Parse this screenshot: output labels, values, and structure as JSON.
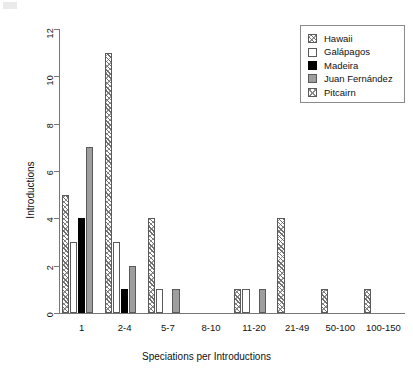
{
  "chart_data": {
    "type": "bar",
    "title": "",
    "xlabel": "Speciations per Introductions",
    "ylabel": "Introductions",
    "categories": [
      "1",
      "2-4",
      "5-7",
      "8-10",
      "11-20",
      "21-49",
      "50-100",
      "100-150"
    ],
    "ylim": [
      0,
      12
    ],
    "yticks": [
      0,
      2,
      4,
      6,
      8,
      10,
      12
    ],
    "grid": false,
    "legend_position": "top-right",
    "series": [
      {
        "name": "Hawaii",
        "pattern": "diagonal-hatch",
        "values": [
          5,
          11,
          4,
          0,
          1,
          4,
          1,
          1
        ]
      },
      {
        "name": "Galápagos",
        "pattern": "empty",
        "values": [
          3,
          3,
          1,
          0,
          1,
          0,
          0,
          0
        ]
      },
      {
        "name": "Madeira",
        "pattern": "solid-black",
        "values": [
          4,
          1,
          0,
          0,
          0,
          0,
          0,
          0
        ]
      },
      {
        "name": "Juan Fernández",
        "pattern": "solid-gray",
        "values": [
          7,
          2,
          1,
          0,
          1,
          0,
          0,
          0
        ]
      },
      {
        "name": "Pitcairn",
        "pattern": "cross-hatch",
        "values": [
          0,
          0,
          0,
          0,
          0,
          0,
          0,
          0
        ]
      }
    ]
  },
  "legend": {
    "items": [
      {
        "label": "Hawaii"
      },
      {
        "label": "Galápagos"
      },
      {
        "label": "Madeira"
      },
      {
        "label": "Juan Fernández"
      },
      {
        "label": "Pitcairn"
      }
    ]
  },
  "colors": {
    "axis": "#777777",
    "text": "#111111",
    "madeira": "#000000",
    "juan_fernandez": "#9e9e9e",
    "hatch": "#6e6e6e",
    "background": "#ffffff"
  }
}
